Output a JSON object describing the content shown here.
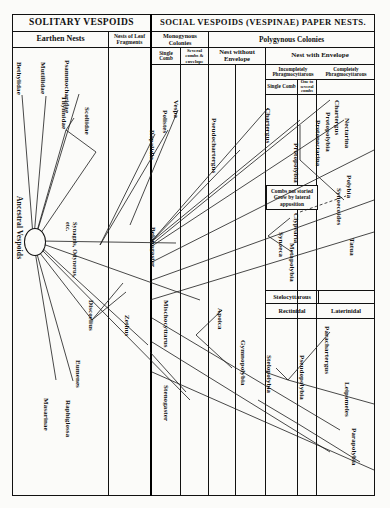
{
  "figure": {
    "title_left": "SOLITARY VESPOIDS",
    "title_right": "SOCIAL VESPOIDS  (VESPINAE) PAPER NESTS.",
    "origin_label": "Ancestral Vespoids"
  },
  "header": {
    "row2": [
      {
        "label": "Earthen Nests"
      },
      {
        "label": "Nests of Leaf Fragments"
      },
      {
        "label": "Monogynous Colonies"
      },
      {
        "label": "Polygynous Colonies"
      }
    ],
    "row3": [
      {
        "label": "Single Comb"
      },
      {
        "label": "Several combs & envelope"
      },
      {
        "label": "Nest without Envelope"
      },
      {
        "label": "Nest with Envelope"
      }
    ],
    "row4": [
      {
        "label": "Incompletely Phragmocyttarous"
      },
      {
        "label": "Completely Phragmocyttarous"
      }
    ],
    "row5": [
      {
        "label": "Single Comb"
      },
      {
        "label": "One to several combs"
      }
    ]
  },
  "annotations": {
    "combs_note": "Combs not storied Grow by lateral apposition",
    "stelocyttarous": "Stelocyttarous",
    "rectinidal": "Rectinidal",
    "laterinidal": "Laterinidal"
  },
  "taxa": {
    "bethylidae": "Bethylidae",
    "mutillidae": "Mutillidae",
    "psammocharidae": "Psammocharidae",
    "thynnidae": "Thynnidae",
    "scoliidae": "Scoliidae",
    "synagris": "Synagris, Odynerus, etc.",
    "discoelius": "Discoelius",
    "zethus": "Zethus",
    "eumenes": "Eumenes",
    "raphiglossa": "Raphiglossa",
    "masarinae": "Masarinae",
    "vespa": "Vespa",
    "polistes": "Polistes",
    "ropalidia": "Ropalidia",
    "belonogaster": "Belonogaster",
    "mischocyttarus": "Mischocyttarus",
    "stenogaster": "Stenogaster",
    "pseudochartergus": "Pseudochartergus",
    "apoica": "Apoica",
    "gymnopolybia": "Gymnopolybia",
    "chartergus1": "Chartergus",
    "chartergus2": "Chartergus",
    "protopolybia1": "Protopolybia",
    "protopolybia2": "Protopolybia",
    "protonectarina": "Protonectarina",
    "nectarina": "Nectarina",
    "polybia": "Polybia",
    "synoecoides": "Synoecoides",
    "tatua": "Tatua",
    "clypearia": "Clypearia",
    "synoeca": "Synoeca",
    "metapolybia": "Metapolybia",
    "stelopolybia": "Stelopolybia",
    "pseudopolybia": "Pseudopolybia",
    "parachartergus": "Parachartergus",
    "leipomeles": "Leipomeles",
    "parapolybia": "Parapolybia"
  },
  "colors": {
    "ink": "#111111",
    "paper": "#fbfbf9"
  }
}
